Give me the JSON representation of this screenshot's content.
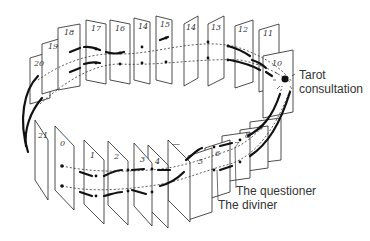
{
  "labels": {
    "tarot": [
      "Tarot",
      "consultation"
    ],
    "questioner": "The questioner",
    "diviner": "The diviner"
  },
  "cards_back": [
    "20",
    "19",
    "18",
    "17",
    "16",
    "14",
    "15",
    "14",
    "13",
    "12",
    "11",
    "10"
  ],
  "cards_front": [
    "21",
    "0",
    "1",
    "2",
    "3",
    "4",
    "—",
    "5",
    "6",
    "7",
    "8",
    "9"
  ],
  "colors": {
    "line": "#111111",
    "card_stroke": "#222222",
    "text": "#333333"
  }
}
